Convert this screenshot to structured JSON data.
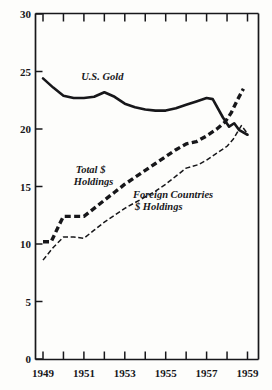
{
  "chart_data": {
    "type": "line",
    "title": "",
    "subtitle": "",
    "xlabel": "",
    "ylabel": "",
    "xlim": [
      1949,
      1959
    ],
    "ylim": [
      0,
      30
    ],
    "grid": false,
    "legend_position": "inline-annotations",
    "y_ticks": [
      "0",
      "5",
      "10",
      "15",
      "20",
      "25",
      "30"
    ],
    "y_tick_values": [
      0,
      5,
      10,
      15,
      20,
      25,
      30
    ],
    "x_ticks": [
      "1949",
      "",
      "1951",
      "",
      "1953",
      "",
      "1955",
      "",
      "1957",
      "",
      "1959"
    ],
    "x_tick_values": [
      1949,
      1950,
      1951,
      1952,
      1953,
      1954,
      1955,
      1956,
      1957,
      1958,
      1959
    ],
    "x_labeled": [
      "1949",
      "1951",
      "1953",
      "1955",
      "1957",
      "1959"
    ],
    "x_labeled_values": [
      1949,
      1951,
      1953,
      1955,
      1957,
      1959
    ],
    "x": [
      1949,
      1949.5,
      1950,
      1950.5,
      1951,
      1951.5,
      1952,
      1952.5,
      1953,
      1953.5,
      1954,
      1954.5,
      1955,
      1955.5,
      1956,
      1956.5,
      1957,
      1957.5,
      1958,
      1958.3,
      1958.6,
      1959
    ],
    "series": [
      {
        "name": "U.S. Gold",
        "style": "solid-thick",
        "x": [
          1949,
          1949.5,
          1950,
          1950.5,
          1951,
          1951.5,
          1952,
          1952.5,
          1953,
          1953.5,
          1954,
          1954.5,
          1955,
          1955.5,
          1956,
          1956.5,
          1957,
          1957.3,
          1957.8,
          1958.1,
          1958.35,
          1958.6,
          1959
        ],
        "values": [
          24.4,
          23.6,
          22.9,
          22.7,
          22.7,
          22.8,
          23.2,
          22.8,
          22.2,
          21.9,
          21.7,
          21.6,
          21.6,
          21.8,
          22.1,
          22.4,
          22.7,
          22.6,
          21.0,
          20.2,
          20.5,
          19.9,
          19.5
        ],
        "label_text": "U.S. Gold",
        "label_x": 1951.9,
        "label_y": 24.3
      },
      {
        "name": "Total $ Holdings",
        "style": "dashed-heavy",
        "x": [
          1949,
          1949.4,
          1949.8,
          1950,
          1950.5,
          1951,
          1951.5,
          1952,
          1952.5,
          1953,
          1953.5,
          1954,
          1954.5,
          1955,
          1955.5,
          1956,
          1956.5,
          1957,
          1957.5,
          1957.9,
          1958.2,
          1958.5,
          1958.8
        ],
        "values": [
          10.2,
          10.2,
          11.7,
          12.4,
          12.4,
          12.4,
          13.1,
          13.8,
          14.5,
          15.2,
          15.8,
          16.4,
          17.0,
          17.6,
          18.2,
          18.7,
          18.9,
          19.4,
          20.0,
          20.6,
          21.4,
          22.5,
          23.5
        ],
        "label_text": "Total $\nHoldings",
        "label_x": 1950.6,
        "label_y": 16.2
      },
      {
        "name": "Foreign Countries $ Holdings",
        "style": "dashed-thin",
        "x": [
          1949,
          1949.5,
          1950,
          1950.5,
          1951,
          1951.5,
          1952,
          1952.5,
          1953,
          1953.5,
          1954,
          1954.5,
          1955,
          1955.5,
          1956,
          1956.2,
          1956.6,
          1957,
          1957.5,
          1958,
          1958.3,
          1958.5,
          1958.7,
          1959
        ],
        "values": [
          8.6,
          9.7,
          10.6,
          10.6,
          10.5,
          11.2,
          11.9,
          12.5,
          13.1,
          13.6,
          14.1,
          14.6,
          15.2,
          15.9,
          16.6,
          16.7,
          16.9,
          17.3,
          17.9,
          18.5,
          19.1,
          19.7,
          20.3,
          19.6
        ],
        "label_text": "Foreign Countries\n$ Holdings",
        "label_x": 1953.4,
        "label_y": 14.0
      }
    ],
    "annotations": [
      {
        "name": "us-gold-label",
        "text": "U.S. Gold"
      },
      {
        "name": "total-holdings-label-line1",
        "text": "Total $"
      },
      {
        "name": "total-holdings-label-line2",
        "text": "Holdings"
      },
      {
        "name": "foreign-label-line1",
        "text": "Foreign Countries"
      },
      {
        "name": "foreign-label-line2",
        "text": "$ Holdings"
      }
    ],
    "colors": {
      "ink": "#17171a",
      "background": "#fdfdfb"
    }
  }
}
